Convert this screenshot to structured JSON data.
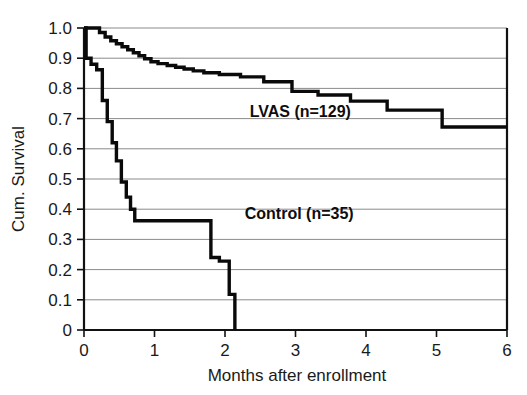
{
  "figure": {
    "background_color": "#ffffff",
    "curve_color": "#0a0a0a",
    "grid_color": "#8a8a8a",
    "axis_color": "#111111"
  },
  "chart_data": {
    "type": "line",
    "subtype": "kaplan-meier-step",
    "title": "",
    "xlabel": "Months after enrollment",
    "ylabel": "Cum. Survival",
    "xlim": [
      0,
      6
    ],
    "ylim": [
      0,
      1.0
    ],
    "xticks": [
      0,
      1,
      2,
      3,
      4,
      5,
      6
    ],
    "xtick_labels": [
      "0",
      "1",
      "2",
      "3",
      "4",
      "5",
      "6"
    ],
    "yticks": [
      0,
      0.1,
      0.2,
      0.3,
      0.4,
      0.5,
      0.6,
      0.7,
      0.8,
      0.9,
      1.0
    ],
    "ytick_labels": [
      "0",
      "0.1",
      "0.2",
      "0.3",
      "0.4",
      "0.5",
      "0.6",
      "0.7",
      "0.8",
      "0.9",
      "1.0"
    ],
    "grid": "horizontal",
    "legend_position": "inline-annotation",
    "series": [
      {
        "name": "LVAS (n=129)",
        "label": "LVAS (n=129)",
        "n": 129,
        "annotation_x": 2.35,
        "annotation_y": 0.705,
        "final_survival": 0.67,
        "x": [
          0.0,
          0.22,
          0.22,
          0.3,
          0.3,
          0.38,
          0.38,
          0.46,
          0.46,
          0.54,
          0.54,
          0.62,
          0.62,
          0.7,
          0.7,
          0.78,
          0.78,
          0.86,
          0.86,
          0.95,
          0.95,
          1.05,
          1.05,
          1.18,
          1.18,
          1.3,
          1.3,
          1.42,
          1.42,
          1.55,
          1.55,
          1.7,
          1.7,
          1.92,
          1.92,
          2.22,
          2.22,
          2.55,
          2.55,
          2.95,
          2.95,
          3.32,
          3.32,
          3.78,
          3.78,
          4.3,
          4.3,
          5.08,
          5.08,
          6.0
        ],
        "y": [
          1.0,
          1.0,
          0.985,
          0.985,
          0.97,
          0.97,
          0.958,
          0.958,
          0.948,
          0.948,
          0.938,
          0.938,
          0.928,
          0.928,
          0.918,
          0.918,
          0.908,
          0.908,
          0.898,
          0.898,
          0.888,
          0.888,
          0.882,
          0.882,
          0.876,
          0.876,
          0.87,
          0.87,
          0.864,
          0.864,
          0.858,
          0.858,
          0.852,
          0.852,
          0.846,
          0.846,
          0.838,
          0.838,
          0.822,
          0.822,
          0.79,
          0.79,
          0.778,
          0.778,
          0.758,
          0.758,
          0.728,
          0.728,
          0.672,
          0.672
        ]
      },
      {
        "name": "Control (n=35)",
        "label": "Control (n=35)",
        "n": 35,
        "annotation_x": 2.28,
        "annotation_y": 0.368,
        "final_survival": 0.0,
        "x": [
          0.0,
          0.03,
          0.03,
          0.1,
          0.1,
          0.18,
          0.18,
          0.26,
          0.26,
          0.33,
          0.33,
          0.4,
          0.4,
          0.46,
          0.46,
          0.53,
          0.53,
          0.6,
          0.6,
          0.66,
          0.66,
          0.72,
          0.72,
          1.8,
          1.8,
          1.92,
          1.92,
          2.06,
          2.06,
          2.14,
          2.14
        ],
        "y": [
          1.0,
          1.0,
          0.9,
          0.9,
          0.88,
          0.88,
          0.862,
          0.862,
          0.76,
          0.76,
          0.69,
          0.69,
          0.62,
          0.62,
          0.56,
          0.56,
          0.49,
          0.49,
          0.44,
          0.44,
          0.4,
          0.4,
          0.362,
          0.362,
          0.24,
          0.24,
          0.228,
          0.228,
          0.118,
          0.118,
          0.0
        ]
      }
    ]
  }
}
